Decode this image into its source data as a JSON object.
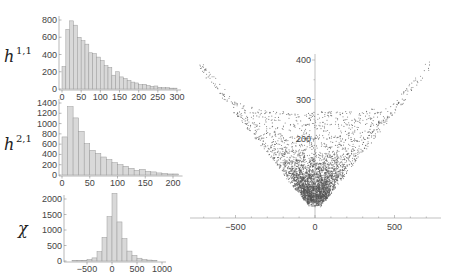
{
  "chart_data": [
    {
      "type": "bar",
      "title": "",
      "ylabel_html": "h^{1,1}",
      "ylabel": "h",
      "ylabel_sup": "1,1",
      "xlabel": "",
      "bin_width": 10,
      "bin_start": 0,
      "values": [
        260,
        690,
        790,
        740,
        600,
        560,
        520,
        420,
        410,
        370,
        330,
        270,
        250,
        160,
        200,
        140,
        120,
        100,
        80,
        70,
        50,
        55,
        40,
        30,
        35,
        20,
        15,
        15,
        10,
        10
      ],
      "xticks": [
        0,
        50,
        100,
        150,
        200,
        250,
        300
      ],
      "yticks": [
        0,
        200,
        400,
        600,
        800
      ],
      "xlim": [
        0,
        300
      ],
      "ylim": [
        0,
        800
      ]
    },
    {
      "type": "bar",
      "title": "",
      "ylabel": "h",
      "ylabel_sup": "2,1",
      "xlabel": "",
      "bin_width": 10,
      "bin_start": 0,
      "values": [
        740,
        1330,
        1110,
        850,
        610,
        480,
        420,
        350,
        300,
        240,
        200,
        170,
        130,
        90,
        110,
        70,
        60,
        40,
        30,
        20,
        20
      ],
      "xticks": [
        0,
        50,
        100,
        150,
        200
      ],
      "yticks": [
        0,
        200,
        400,
        600,
        800,
        1000,
        1200,
        1400
      ],
      "xlim": [
        0,
        210
      ],
      "ylim": [
        0,
        1400
      ]
    },
    {
      "type": "bar",
      "title": "",
      "ylabel": "χ",
      "ylabel_sup": "",
      "xlabel": "",
      "bin_width": 100,
      "bin_start": -800,
      "values": [
        10,
        10,
        20,
        50,
        100,
        300,
        760,
        1430,
        2180,
        1260,
        720,
        320,
        180,
        90,
        50,
        30,
        15
      ],
      "xticks": [
        -500,
        0,
        500,
        1000
      ],
      "yticks": [
        0,
        500,
        1000,
        1500,
        2000
      ],
      "xlim": [
        -800,
        1000
      ],
      "ylim": [
        0,
        2200
      ]
    },
    {
      "type": "scatter",
      "title": "",
      "xlabel": "",
      "ylabel": "",
      "description": "V-shaped point cloud: Hodge numbers (h11+h21) vs Euler number chi; dense near x=0, y~30-100, bounded by |x|/2 <= y, with sparse arcs up to y~400",
      "xticks": [
        -500,
        0,
        500
      ],
      "yticks": [
        200,
        300,
        400
      ],
      "xlim": [
        -780,
        780
      ],
      "ylim": [
        0,
        420
      ],
      "grid": false,
      "axes_origin": [
        0,
        0
      ]
    }
  ]
}
